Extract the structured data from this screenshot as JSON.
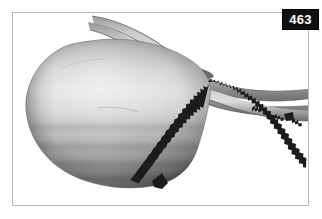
{
  "figure": {
    "plate_number": "463",
    "caption": "",
    "background_color": "#ffffff",
    "frame_color": "#b9b9b9",
    "badge_background_color": "#111111",
    "badge_text_color": "#ffffff"
  },
  "illustration": {
    "body": {
      "name": "rounded-body",
      "highlight_color": "#e4e4e4",
      "midtone_color": "#b6b6b6",
      "shadow_color": "#6b6b6b",
      "deep_shadow_color": "#4f4f4f",
      "outline_color": "#5a5a5a"
    },
    "stalk": {
      "name": "curved-stalk",
      "highlight_color": "#d9d9d9",
      "midtone_color": "#a8a8a8",
      "shadow_color": "#707070",
      "spot_color": "#555555"
    },
    "tail": {
      "name": "tapering-tail",
      "highlight_color": "#dcdcdc",
      "midtone_color": "#a9a9a9",
      "shadow_color": "#6d6d6d"
    },
    "serrated_margin": {
      "name": "serrated-margin",
      "color": "#1c1c1c",
      "tooth_count": 46
    }
  }
}
